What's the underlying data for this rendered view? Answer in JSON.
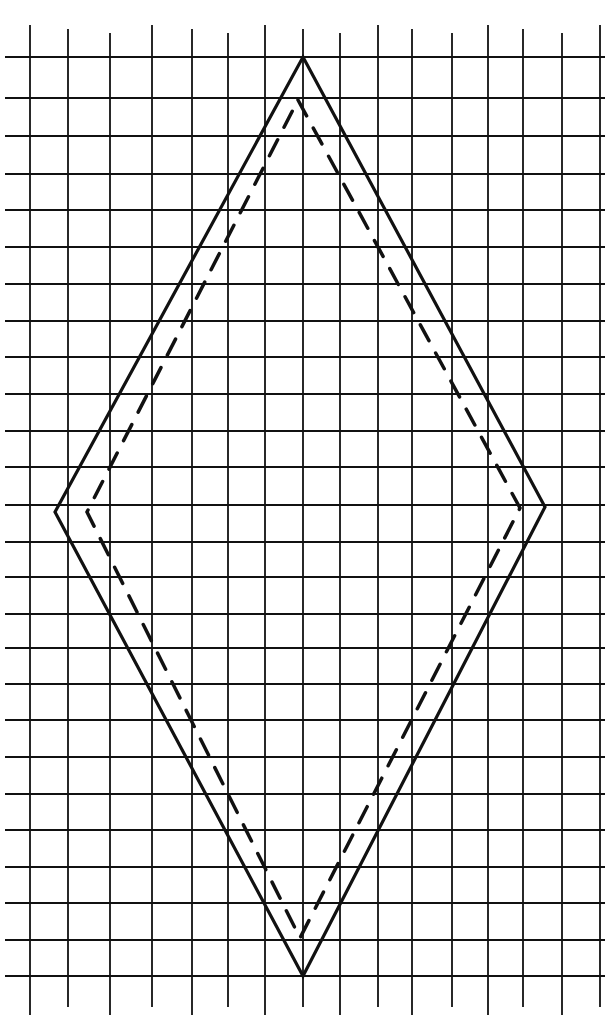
{
  "diagram": {
    "title": "",
    "background": "#ffffff",
    "ink_color": "#111111",
    "grid": {
      "vertical_lines_x": [
        30,
        68,
        110,
        152,
        192,
        228,
        265,
        303,
        340,
        378,
        412,
        452,
        488,
        523,
        562,
        600
      ],
      "horizontal_lines_y": [
        57,
        98,
        136,
        174,
        210,
        247,
        284,
        321,
        357,
        394,
        431,
        467,
        505,
        542,
        577,
        614,
        648,
        684,
        720,
        757,
        794,
        830,
        867,
        903,
        940,
        976
      ],
      "x_extent": [
        5,
        605
      ],
      "y_extent": [
        25,
        1015
      ]
    },
    "shapes": [
      {
        "name": "outer-diamond",
        "style": "solid",
        "points": [
          [
            303,
            57
          ],
          [
            545,
            507
          ],
          [
            303,
            976
          ],
          [
            55,
            512
          ]
        ]
      },
      {
        "name": "inner-diamond",
        "style": "dashed",
        "points": [
          [
            298,
            100
          ],
          [
            520,
            508
          ],
          [
            300,
            938
          ],
          [
            87,
            512
          ]
        ]
      }
    ]
  }
}
